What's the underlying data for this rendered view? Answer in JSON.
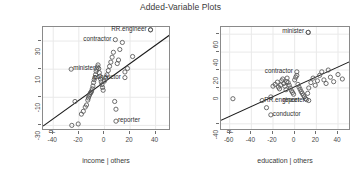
{
  "chart_data": [
    {
      "type": "scatter",
      "panel": "left",
      "title": "Added-Variable Plots",
      "xlabel": "income | others",
      "ylabel": "prestige | others",
      "xlim": [
        -48,
        52
      ],
      "ylim": [
        -34,
        40
      ],
      "xticks": [
        -40,
        -20,
        0,
        20,
        40
      ],
      "yticks": [
        30,
        10,
        -10,
        -30
      ],
      "grid": true,
      "legend": "none",
      "regression_line": {
        "x0": -48,
        "y0": -30.5,
        "x1": 52,
        "y1": 35.0
      },
      "x": [
        -25.5,
        -23.0,
        -20.5,
        -18.0,
        -16.5,
        -15.0,
        -14.0,
        -13.0,
        -12.5,
        -12.0,
        -11.5,
        -11.0,
        -10.5,
        -10.0,
        -9.5,
        -9.0,
        -8.5,
        -8.0,
        -7.5,
        -7.0,
        -6.5,
        -6.0,
        -5.5,
        -5.0,
        -4.5,
        -4.0,
        -3.5,
        -3.0,
        -2.5,
        -2.0,
        -1.5,
        -1.0,
        0.0,
        1.0,
        2.0,
        3.0,
        4.0,
        5.0,
        6.0,
        7.0,
        8.0,
        9.0,
        10.0,
        11.0,
        12.0,
        14.0,
        16.0,
        18.0,
        22.0,
        36.0
      ],
      "y": [
        -30.0,
        -13.0,
        -29.0,
        -22.0,
        -20.0,
        -17.0,
        -15.5,
        -12.0,
        -10.5,
        -9.0,
        -8.0,
        -7.0,
        -6.5,
        -5.5,
        -4.0,
        -2.0,
        0.5,
        2.5,
        4.0,
        6.0,
        8.5,
        10.0,
        11.5,
        13.0,
        10.5,
        7.5,
        5.0,
        3.0,
        1.0,
        -1.0,
        -3.0,
        -5.0,
        1.5,
        3.5,
        6.0,
        9.0,
        12.0,
        15.0,
        18.5,
        22.0,
        -13.0,
        -18.5,
        14.0,
        16.5,
        24.0,
        29.0,
        8.0,
        10.5,
        19.0,
        38.0
      ],
      "labeled_points": [
        {
          "name": "RR.engineer",
          "x": 36.0,
          "y": 38.0,
          "anchor": "right"
        },
        {
          "name": "contractor",
          "x": 8.5,
          "y": 31.0,
          "anchor": "right"
        },
        {
          "name": "minister",
          "x": -26.0,
          "y": 10.0,
          "anchor": "left"
        },
        {
          "name": "conductor",
          "x": 16.0,
          "y": 4.0,
          "anchor": "right"
        },
        {
          "name": "reporter",
          "x": 9.0,
          "y": -27.0,
          "anchor": "left"
        }
      ]
    },
    {
      "type": "scatter",
      "panel": "right",
      "title": "Added-Variable Plots",
      "xlabel": "education | others",
      "ylabel": "prestige | others",
      "xlim": [
        -68,
        52
      ],
      "ylim": [
        -48,
        68
      ],
      "xticks": [
        -60,
        -40,
        -20,
        0,
        20,
        40
      ],
      "yticks": [
        60,
        40,
        20,
        0,
        -40
      ],
      "grid": true,
      "legend": "none",
      "regression_line": {
        "x0": -68,
        "y0": -36.0,
        "x1": 52,
        "y1": 30.0
      },
      "x": [
        -57.0,
        -26.0,
        -22.0,
        -20.0,
        -18.0,
        -16.0,
        -15.0,
        -14.0,
        -13.0,
        -12.0,
        -11.0,
        -10.0,
        -9.0,
        -8.0,
        -7.5,
        -7.0,
        -6.0,
        -5.0,
        -4.0,
        -3.0,
        -2.0,
        -1.0,
        0.0,
        1.0,
        2.0,
        3.0,
        4.0,
        5.0,
        6.0,
        7.0,
        8.0,
        9.0,
        10.0,
        11.0,
        12.0,
        13.0,
        15.0,
        17.0,
        19.0,
        21.0,
        23.0,
        25.0,
        27.0,
        29.0,
        31.0,
        33.0,
        36.0,
        40.0,
        44.0,
        12.5
      ],
      "y": [
        -12.0,
        -22.0,
        -10.0,
        2.0,
        4.0,
        6.5,
        1.0,
        -1.0,
        3.0,
        8.0,
        10.0,
        5.0,
        2.0,
        -2.0,
        7.0,
        11.0,
        6.0,
        3.0,
        0.0,
        -3.0,
        -5.0,
        -7.0,
        9.0,
        12.0,
        14.0,
        4.0,
        1.0,
        -1.5,
        -4.0,
        -6.0,
        -8.0,
        -10.0,
        -12.0,
        -13.0,
        -6.0,
        0.0,
        6.0,
        11.0,
        3.0,
        8.0,
        14.0,
        18.0,
        9.0,
        5.0,
        20.0,
        12.0,
        7.0,
        15.0,
        10.0,
        62.0
      ],
      "labeled_points": [
        {
          "name": "minister",
          "x": 12.5,
          "y": 62.0,
          "anchor": "right"
        },
        {
          "name": "contractor",
          "x": 2.0,
          "y": 18.0,
          "anchor": "right"
        },
        {
          "name": "RR.engineer",
          "x": -30.0,
          "y": -14.0,
          "anchor": "left"
        },
        {
          "name": "reporter",
          "x": 13.0,
          "y": -14.0,
          "anchor": "right"
        },
        {
          "name": "conductor",
          "x": -22.0,
          "y": -30.0,
          "anchor": "left"
        }
      ]
    }
  ],
  "title": "Added-Variable Plots",
  "left_panel": {
    "xlabel": "income | others",
    "ylabel": "prestige | others",
    "xticks": [
      "-40",
      "-20",
      "0",
      "20",
      "40"
    ],
    "yticks": [
      "30",
      "10",
      "-10",
      "-30"
    ],
    "labels": {
      "rr_engineer": "RR.engineer",
      "contractor": "contractor",
      "minister": "minister",
      "conductor": "conductor",
      "reporter": "reporter"
    }
  },
  "right_panel": {
    "xlabel": "education | others",
    "ylabel": "prestige | others",
    "xticks": [
      "-60",
      "-40",
      "-20",
      "0",
      "20",
      "40"
    ],
    "yticks": [
      "60",
      "40",
      "20",
      "0",
      "-40"
    ],
    "labels": {
      "minister": "minister",
      "contractor": "contractor",
      "rr_engineer": "RR.engineer",
      "reporter": "reporter",
      "conductor": "conductor"
    }
  },
  "colors": {
    "point": "#555555",
    "line": "#1a1a1a",
    "grid": "#e9e9e9",
    "axis": "#8a8a8a",
    "text": "#3a3a3a"
  }
}
